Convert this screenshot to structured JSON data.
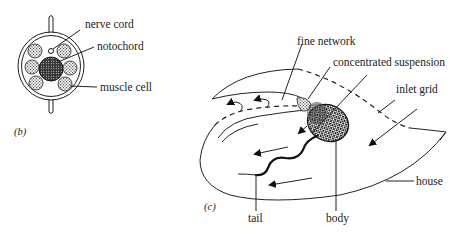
{
  "figure": {
    "panels": [
      {
        "id": "b",
        "panel_label": "(b)",
        "description": "Cross-section of tail",
        "labels": {
          "nerve_cord": "nerve cord",
          "notochord": "notochord",
          "muscle_cell": "muscle cell"
        }
      },
      {
        "id": "c",
        "panel_label": "(c)",
        "description": "Animal inside its filter house",
        "labels": {
          "fine_network": "fine network",
          "concentrated_suspension": "concentrated suspension",
          "inlet_grid": "inlet grid",
          "house": "house",
          "tail": "tail",
          "body": "body"
        }
      }
    ],
    "colors": {
      "ink": "#222222",
      "background": "#ffffff"
    }
  }
}
